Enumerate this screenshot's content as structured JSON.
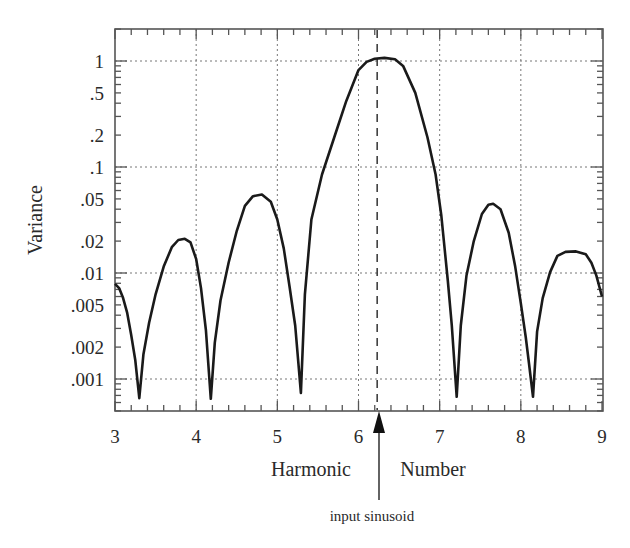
{
  "chart_data": {
    "type": "line",
    "title": "",
    "xlabel": "Harmonic Number",
    "xlabel_parts": [
      "Harmonic",
      "Number"
    ],
    "ylabel": "Variance",
    "yscale": "log",
    "xlim": [
      3,
      9
    ],
    "ylim": [
      0.0004,
      2.2
    ],
    "grid": true,
    "grid_style": "dotted",
    "x_ticks": [
      3,
      4,
      5,
      6,
      7,
      8,
      9
    ],
    "x_tick_labels": [
      "3",
      "4",
      "5",
      "6",
      "7",
      "8",
      "9"
    ],
    "y_ticks": [
      1,
      0.5,
      0.2,
      0.1,
      0.05,
      0.02,
      0.01,
      0.005,
      0.002,
      0.001
    ],
    "y_tick_labels": [
      "1",
      ".5",
      ".2",
      ".1",
      ".05",
      ".02",
      ".01",
      ".005",
      ".002",
      ".001"
    ],
    "y_grid_at": [
      1,
      0.1,
      0.01,
      0.001
    ],
    "x_grid_at": [
      4,
      5,
      6,
      7,
      8
    ],
    "annotations": [
      {
        "type": "vline-dashed",
        "x": 6.23,
        "label": "input sinusoid",
        "arrow": "up from below x-axis"
      }
    ],
    "series": [
      {
        "name": "variance",
        "x": [
          3.0,
          3.05,
          3.1,
          3.15,
          3.2,
          3.25,
          3.3,
          3.35,
          3.42,
          3.5,
          3.6,
          3.7,
          3.78,
          3.86,
          3.93,
          4.0,
          4.06,
          4.12,
          4.18,
          4.23,
          4.3,
          4.4,
          4.5,
          4.6,
          4.7,
          4.81,
          4.92,
          5.0,
          5.08,
          5.15,
          5.22,
          5.29,
          5.34,
          5.42,
          5.55,
          5.7,
          5.85,
          6.0,
          6.1,
          6.2,
          6.32,
          6.45,
          6.55,
          6.7,
          6.85,
          6.95,
          7.02,
          7.1,
          7.15,
          7.21,
          7.26,
          7.33,
          7.42,
          7.52,
          7.6,
          7.66,
          7.75,
          7.85,
          7.93,
          8.0,
          8.06,
          8.1,
          8.15,
          8.2,
          8.27,
          8.36,
          8.45,
          8.55,
          8.68,
          8.8,
          8.87,
          8.93,
          9.0
        ],
        "values": [
          0.0079,
          0.0072,
          0.0058,
          0.0042,
          0.0026,
          0.0015,
          0.00066,
          0.0017,
          0.0034,
          0.0063,
          0.0115,
          0.0175,
          0.0205,
          0.021,
          0.0195,
          0.0135,
          0.0072,
          0.0029,
          0.00065,
          0.0022,
          0.0055,
          0.0125,
          0.025,
          0.043,
          0.053,
          0.055,
          0.047,
          0.032,
          0.017,
          0.0075,
          0.0032,
          0.00074,
          0.0063,
          0.032,
          0.085,
          0.19,
          0.42,
          0.82,
          0.98,
          1.05,
          1.07,
          1.04,
          0.9,
          0.5,
          0.19,
          0.085,
          0.035,
          0.0085,
          0.0032,
          0.00068,
          0.0032,
          0.0095,
          0.02,
          0.036,
          0.044,
          0.045,
          0.04,
          0.024,
          0.0115,
          0.0052,
          0.0025,
          0.0014,
          0.00068,
          0.0028,
          0.0058,
          0.0102,
          0.0145,
          0.0158,
          0.016,
          0.015,
          0.0125,
          0.0095,
          0.006
        ]
      }
    ]
  },
  "axes": {
    "ylabel": "Variance",
    "xlabel_left": "Harmonic",
    "xlabel_right": "Number",
    "annotation": "input sinusoid",
    "x_tick_labels": [
      "3",
      "4",
      "5",
      "6",
      "7",
      "8",
      "9"
    ],
    "y_tick_labels": [
      "1",
      ".5",
      ".2",
      ".1",
      ".05",
      ".02",
      ".01",
      ".005",
      ".002",
      ".001"
    ]
  },
  "colors": {
    "line": "#1a1a1a",
    "frame": "#555555",
    "grid": "#777777",
    "text": "#2a2a2a"
  }
}
